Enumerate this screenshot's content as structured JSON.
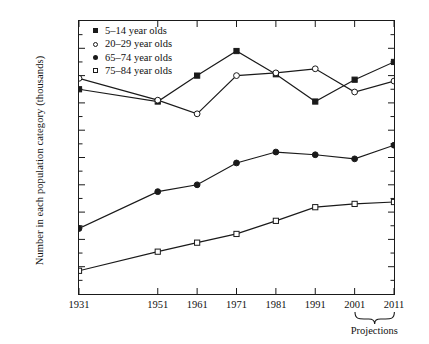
{
  "chart_data": {
    "type": "line",
    "title": "",
    "xlabel": "",
    "ylabel": "Number in each population category (thousands)",
    "categories": [
      "1931",
      "1951",
      "1961",
      "1971",
      "1981",
      "1991",
      "2001",
      "2011"
    ],
    "x": [
      1931,
      1951,
      1961,
      1971,
      1981,
      1991,
      2001,
      2011
    ],
    "xlim": [
      1931,
      2011
    ],
    "ylim": [
      0,
      10000
    ],
    "yticks": [
      1000,
      2000,
      3000,
      4000,
      5000,
      6000,
      7000,
      8000,
      9000,
      10000
    ],
    "ytick_labels": [
      "1000",
      "2000",
      "3000",
      "4000",
      "5000",
      "6000",
      "7000",
      "8000",
      "9000",
      "10 000"
    ],
    "minor_tick_interval": 500,
    "grid": false,
    "legend_position": "top-left",
    "annotations": [
      {
        "text": "Projections",
        "covers": [
          "2001",
          "2011"
        ],
        "type": "brace"
      }
    ],
    "series": [
      {
        "name": "5–14 year olds",
        "marker": "filled-square",
        "values": [
          7500,
          7050,
          8000,
          8900,
          8050,
          7050,
          7850,
          8500
        ]
      },
      {
        "name": "20–29 year olds",
        "marker": "open-circle",
        "values": [
          7900,
          7100,
          6600,
          8000,
          8100,
          8250,
          7400,
          7800
        ]
      },
      {
        "name": "65–74 year olds",
        "marker": "filled-circle",
        "values": [
          2400,
          3750,
          4000,
          4800,
          5200,
          5100,
          4950,
          5450
        ]
      },
      {
        "name": "75–84 year olds",
        "marker": "open-square",
        "values": [
          850,
          1550,
          1880,
          2200,
          2680,
          3180,
          3300,
          3370
        ]
      }
    ]
  },
  "legend": {
    "items": [
      {
        "label": "5–14 year olds",
        "marker": "filled-square"
      },
      {
        "label": "20–29 year olds",
        "marker": "open-circle"
      },
      {
        "label": "65–74 year olds",
        "marker": "filled-circle"
      },
      {
        "label": "75–84 year olds",
        "marker": "open-square"
      }
    ]
  },
  "projections": {
    "label": "Projections"
  },
  "colors": {
    "ink": "#1a1a1a",
    "background": "#ffffff"
  }
}
